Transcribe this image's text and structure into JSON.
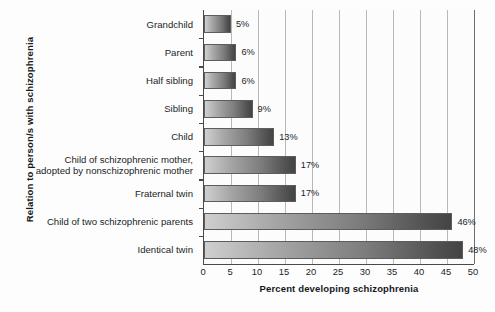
{
  "chart_data": {
    "type": "bar",
    "orientation": "horizontal",
    "title": "",
    "xlabel": "Percent developing schizophrenia",
    "ylabel": "Relation to person/s with schizophrenia",
    "xlim": [
      0,
      50
    ],
    "xticks": [
      0,
      5,
      10,
      15,
      20,
      25,
      30,
      35,
      40,
      45,
      50
    ],
    "xtick_labels": [
      "0",
      "5",
      "10",
      "15",
      "20",
      "25",
      "30",
      "35",
      "40",
      "45",
      "50"
    ],
    "grid": true,
    "legend": "none",
    "categories": [
      "Grandchild",
      "Parent",
      "Half sibling",
      "Sibling",
      "Child",
      "Child of schizophrenic mother,\nadopted by nonschizophrenic mother",
      "Fraternal twin",
      "Child of two schizophrenic parents",
      "Identical twin"
    ],
    "values": [
      5,
      6,
      6,
      9,
      13,
      17,
      17,
      46,
      48
    ],
    "value_labels": [
      "5%",
      "6%",
      "6%",
      "9%",
      "13%",
      "17%",
      "17%",
      "46%",
      "48%"
    ]
  },
  "style": {
    "bar_gradient_start": "#cfcfcf",
    "bar_gradient_end": "#444444",
    "bar_border": "#5d5d5d",
    "axis_color": "#4a4a4a",
    "gridline_color": "#b9b9b9",
    "text_color": "#1b1d1f",
    "background": "#fdfdfd"
  }
}
